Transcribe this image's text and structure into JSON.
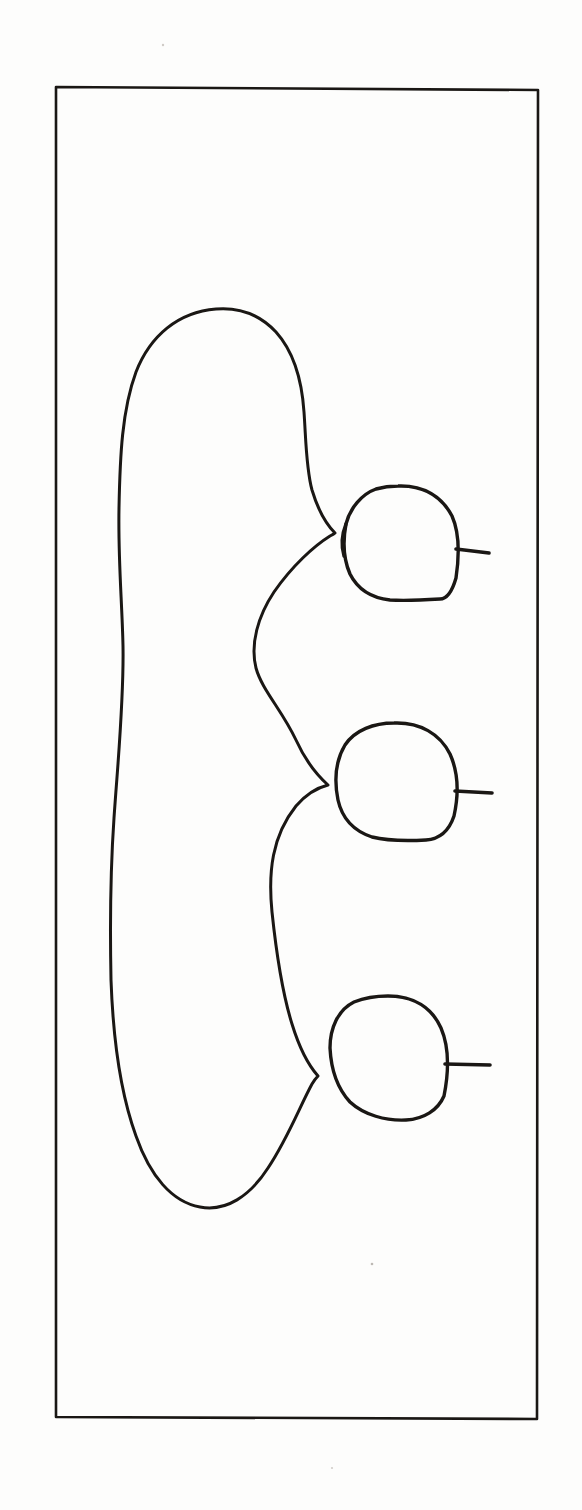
{
  "figure": {
    "background_color": "#fdfdfc",
    "ink_color": "#1a1714",
    "frame": {
      "name": "rectangular-border",
      "x": 55,
      "y": 86,
      "width": 483,
      "height": 1334,
      "stroke_width": 2.6
    },
    "parts": [
      {
        "id": "left-lobe",
        "label": "large elongated left lobe",
        "shape": "closed-outline",
        "top_y": 308,
        "bottom_y": 1208,
        "left_x": 111,
        "right_x": 335
      },
      {
        "id": "circle-1",
        "label": "upper circular body",
        "shape": "circle",
        "cx": 400,
        "cy": 542,
        "rx": 56,
        "ry": 58
      },
      {
        "id": "circle-2",
        "label": "middle circular body",
        "shape": "circle",
        "cx": 396,
        "cy": 782,
        "rx": 59,
        "ry": 59
      },
      {
        "id": "circle-3",
        "label": "lower circular body",
        "shape": "circle",
        "cx": 388,
        "cy": 1058,
        "rx": 58,
        "ry": 63
      }
    ],
    "cusps": [
      {
        "id": "cusp-1",
        "x": 335,
        "y": 533
      },
      {
        "id": "cusp-2",
        "x": 328,
        "y": 785
      },
      {
        "id": "cusp-3",
        "x": 318,
        "y": 1076
      }
    ],
    "tails": [
      {
        "id": "tail-1",
        "x1": 456,
        "y1": 549,
        "x2": 489,
        "y2": 553
      },
      {
        "id": "tail-2",
        "x1": 455,
        "y1": 791,
        "x2": 492,
        "y2": 793
      },
      {
        "id": "tail-3",
        "x1": 445,
        "y1": 1064,
        "x2": 490,
        "y2": 1065
      }
    ],
    "specks": [
      {
        "id": "speck-top",
        "x": 163,
        "y": 45,
        "r": 1.2
      },
      {
        "id": "speck-mid",
        "x": 372,
        "y": 1264,
        "r": 1.3
      },
      {
        "id": "speck-low",
        "x": 332,
        "y": 1468,
        "r": 1.1
      }
    ]
  },
  "caption": {
    "text": ""
  }
}
